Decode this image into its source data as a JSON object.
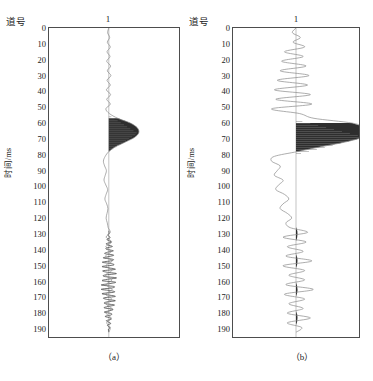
{
  "figure": {
    "axis_title_y": "时间/ms",
    "axis_title_x": "道号",
    "trace_number": "1",
    "caption_a": "（a）",
    "caption_b": "（b）",
    "colors": {
      "axis": "#4d4d4d",
      "wiggle": "#8a8a8a",
      "fill": "#2e2e2e",
      "background": "#ffffff"
    }
  },
  "chart_data": {
    "type": "line",
    "title": "",
    "subtitle": "",
    "xlabel": "道号",
    "ylabel": "时间/ms",
    "grid": false,
    "legend": null,
    "axis_orientation": "time-increases-downward",
    "ylim": [
      0,
      195
    ],
    "yticks": [
      0,
      10,
      20,
      30,
      40,
      50,
      60,
      70,
      80,
      90,
      100,
      110,
      120,
      130,
      140,
      150,
      160,
      170,
      180,
      190
    ],
    "ytick_labels": [
      "0",
      "10",
      "20",
      "30",
      "40",
      "50",
      "60",
      "70",
      "80",
      "90",
      "100",
      "110",
      "120",
      "130",
      "140",
      "150",
      "160",
      "170",
      "180",
      "190"
    ],
    "minor_tick_interval": 2,
    "xticks": [
      1
    ],
    "xtick_labels": [
      "1"
    ],
    "panels": [
      {
        "id": "a",
        "caption": "（a）",
        "trace_label": "1",
        "description": "single seismic wiggle trace, low amplitude, one filled main lobe near 65 ms and a high-frequency low-amplitude burst from 130 to 192 ms",
        "baseline_x_fraction": 0.46,
        "amplitude_scale": 1.0,
        "main_lobe": {
          "t_start": 55,
          "t_peak": 66,
          "t_end": 78,
          "peak_amplitude": 1.0
        },
        "burst": {
          "t_start": 128,
          "t_end": 192,
          "peak_amplitude": 0.12
        },
        "samples_t": [
          0,
          3,
          6,
          9,
          12,
          15,
          18,
          21,
          24,
          27,
          30,
          33,
          36,
          39,
          42,
          45,
          48,
          51,
          54,
          57,
          60,
          63,
          66,
          69,
          72,
          75,
          78,
          81,
          84,
          87,
          90,
          93,
          96,
          99,
          102,
          105,
          108,
          111,
          114,
          117,
          120,
          123,
          126,
          129,
          132,
          135,
          138,
          141,
          144,
          147,
          150,
          153,
          156,
          159,
          162,
          165,
          168,
          171,
          174,
          177,
          180,
          183,
          186,
          189,
          192
        ],
        "samples_a": [
          0.0,
          -0.04,
          0.03,
          -0.05,
          0.05,
          -0.06,
          0.04,
          -0.07,
          0.06,
          -0.05,
          0.07,
          -0.06,
          0.05,
          -0.08,
          0.06,
          -0.07,
          0.05,
          -0.1,
          0.02,
          0.3,
          0.72,
          0.95,
          1.0,
          0.86,
          0.55,
          0.22,
          0.0,
          -0.12,
          -0.18,
          -0.14,
          -0.08,
          -0.12,
          -0.16,
          -0.1,
          -0.04,
          -0.09,
          -0.13,
          -0.07,
          -0.03,
          -0.06,
          -0.09,
          -0.05,
          -0.02,
          0.05,
          -0.09,
          0.1,
          -0.1,
          0.09,
          -0.11,
          0.11,
          -0.1,
          0.1,
          -0.11,
          0.1,
          -0.09,
          0.11,
          -0.1,
          0.09,
          -0.1,
          0.1,
          -0.09,
          0.08,
          -0.07,
          0.05,
          0.0
        ]
      },
      {
        "id": "b",
        "caption": "（b）",
        "trace_label": "1",
        "description": "single seismic wiggle trace, higher amplitude with multiple oscillations, large filled main lobe near 68 ms and four discrete filled lobes at 130, 147, 165 and 183 ms",
        "baseline_x_fraction": 0.5,
        "amplitude_scale": 2.4,
        "main_lobe": {
          "t_start": 58,
          "t_peak": 68,
          "t_end": 80,
          "peak_amplitude": 1.0
        },
        "secondary_lobes_t": [
          130,
          147,
          165,
          183
        ],
        "samples_t": [
          0,
          3,
          6,
          9,
          12,
          15,
          18,
          21,
          24,
          27,
          30,
          33,
          36,
          39,
          42,
          45,
          48,
          51,
          54,
          57,
          60,
          63,
          66,
          69,
          72,
          75,
          78,
          81,
          84,
          87,
          90,
          93,
          96,
          99,
          102,
          105,
          108,
          111,
          114,
          117,
          120,
          123,
          126,
          129,
          132,
          135,
          138,
          141,
          144,
          147,
          150,
          153,
          156,
          159,
          162,
          165,
          168,
          171,
          174,
          177,
          180,
          183,
          186,
          189,
          192
        ],
        "samples_a": [
          0.0,
          -0.05,
          0.06,
          -0.04,
          0.12,
          -0.16,
          0.1,
          -0.2,
          0.14,
          -0.22,
          0.18,
          -0.26,
          0.16,
          -0.3,
          0.2,
          -0.28,
          0.22,
          -0.34,
          0.05,
          0.25,
          0.78,
          0.96,
          1.0,
          0.92,
          0.68,
          0.34,
          0.02,
          -0.3,
          -0.34,
          -0.22,
          -0.26,
          -0.3,
          -0.18,
          -0.24,
          -0.28,
          -0.16,
          -0.1,
          -0.18,
          -0.22,
          -0.12,
          -0.06,
          -0.14,
          -0.08,
          0.16,
          -0.18,
          0.14,
          -0.12,
          0.1,
          -0.14,
          0.22,
          -0.18,
          0.12,
          -0.1,
          0.12,
          -0.14,
          0.24,
          -0.16,
          0.12,
          -0.1,
          0.1,
          -0.12,
          0.2,
          -0.12,
          0.08,
          0.0
        ]
      }
    ]
  }
}
